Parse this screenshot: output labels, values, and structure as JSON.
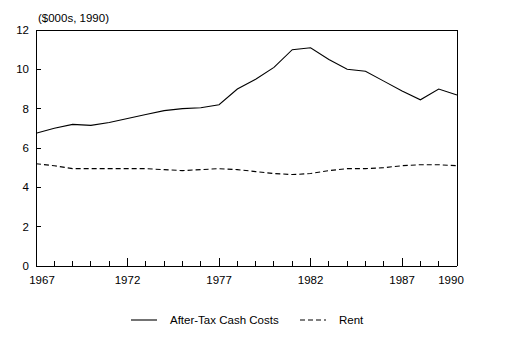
{
  "chart_data": {
    "type": "line",
    "title": "($000s, 1990)",
    "xlabel": "",
    "ylabel": "",
    "xlim": [
      1967,
      1990
    ],
    "ylim": [
      0,
      12
    ],
    "yticks": [
      0,
      2,
      4,
      6,
      8,
      10,
      12
    ],
    "ytick_labels": [
      "0",
      "2",
      "4",
      "6",
      "8",
      "10",
      "12"
    ],
    "xticks": [
      1967,
      1968,
      1969,
      1970,
      1971,
      1972,
      1973,
      1974,
      1975,
      1976,
      1977,
      1978,
      1979,
      1980,
      1981,
      1982,
      1983,
      1984,
      1985,
      1986,
      1987,
      1988,
      1989,
      1990
    ],
    "xtick_labels_shown": [
      "1967",
      "1972",
      "1977",
      "1982",
      "1987",
      "1990"
    ],
    "xtick_labels_years": [
      1967,
      1972,
      1977,
      1982,
      1987,
      1990
    ],
    "grid": false,
    "legend_position": "bottom",
    "x": [
      1967,
      1968,
      1969,
      1970,
      1971,
      1972,
      1973,
      1974,
      1975,
      1976,
      1977,
      1978,
      1979,
      1980,
      1981,
      1982,
      1983,
      1984,
      1985,
      1986,
      1987,
      1988,
      1989,
      1990
    ],
    "series": [
      {
        "name": "After-Tax Cash Costs",
        "style": "solid",
        "values": [
          6.75,
          7.0,
          7.2,
          7.15,
          7.3,
          7.5,
          7.7,
          7.9,
          8.0,
          8.05,
          8.2,
          9.0,
          9.5,
          10.1,
          11.0,
          11.1,
          10.5,
          10.0,
          9.9,
          9.4,
          8.9,
          8.45,
          9.0,
          8.7
        ]
      },
      {
        "name": "Rent",
        "style": "dashed",
        "values": [
          5.2,
          5.1,
          4.95,
          4.95,
          4.95,
          4.95,
          4.95,
          4.9,
          4.85,
          4.9,
          4.95,
          4.9,
          4.8,
          4.7,
          4.65,
          4.7,
          4.85,
          4.95,
          4.95,
          5.0,
          5.1,
          5.15,
          5.15,
          5.1
        ]
      }
    ],
    "legend": [
      {
        "label": "After-Tax Cash Costs",
        "style": "solid"
      },
      {
        "label": "Rent",
        "style": "dashed"
      }
    ]
  }
}
